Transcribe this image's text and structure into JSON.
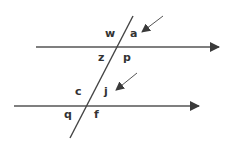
{
  "diagram": {
    "colors": {
      "line": "#555555",
      "arrow": "#3a3a3a",
      "label": "#333333",
      "background": "#ffffff"
    },
    "lines": {
      "top_parallel": {
        "x1": 36,
        "y1": 47,
        "x2": 219,
        "y2": 47,
        "arrowhead": "right"
      },
      "bottom_parallel": {
        "x1": 14,
        "y1": 106,
        "x2": 199,
        "y2": 106,
        "arrowhead": "right"
      },
      "transversal": {
        "x1": 133,
        "y1": 16,
        "x2": 70,
        "y2": 138
      }
    },
    "pointer_arrows": [
      {
        "name": "pointer-to-a",
        "x1": 163,
        "y1": 16,
        "x2": 142,
        "y2": 32
      },
      {
        "name": "pointer-to-j",
        "x1": 137,
        "y1": 73,
        "x2": 116,
        "y2": 90
      }
    ],
    "labels": {
      "w": {
        "text": "w",
        "x": 105,
        "y": 37
      },
      "a": {
        "text": "a",
        "x": 130,
        "y": 37
      },
      "z": {
        "text": "z",
        "x": 98,
        "y": 61
      },
      "p": {
        "text": "p",
        "x": 123,
        "y": 61
      },
      "c": {
        "text": "c",
        "x": 75,
        "y": 95
      },
      "j": {
        "text": "j",
        "x": 104,
        "y": 95
      },
      "q": {
        "text": "q",
        "x": 64,
        "y": 118
      },
      "f": {
        "text": "f",
        "x": 94,
        "y": 118
      }
    }
  }
}
